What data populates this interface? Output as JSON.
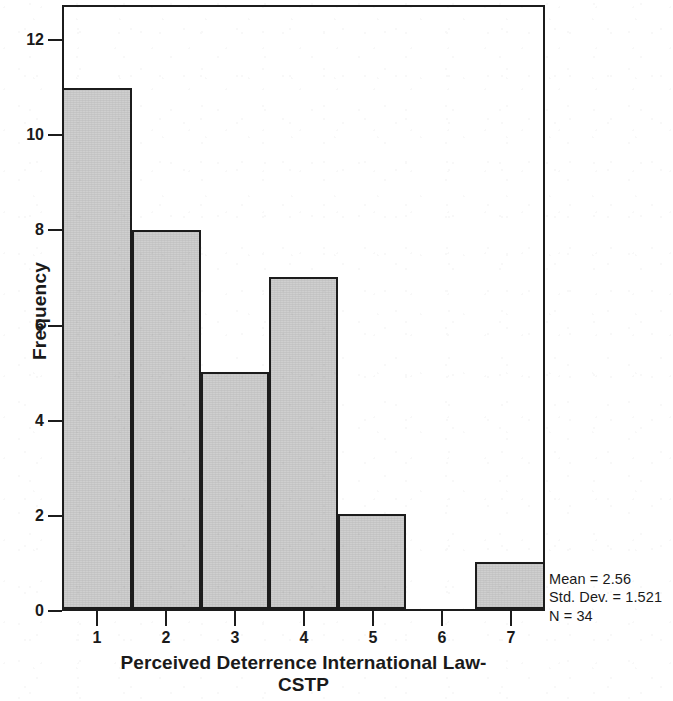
{
  "chart_data": {
    "type": "bar",
    "title": "",
    "subtitle": "",
    "xlabel": "Perceived Deterrence International Law-CSTP",
    "ylabel": "Frequency",
    "categories": [
      "1",
      "2",
      "3",
      "4",
      "5",
      "6",
      "7"
    ],
    "values": [
      11,
      8,
      5,
      7,
      2,
      0,
      1
    ],
    "xlim": [
      0.5,
      7.5
    ],
    "ylim": [
      0,
      12.7
    ],
    "x_ticks": [
      "1",
      "2",
      "3",
      "4",
      "5",
      "6",
      "7"
    ],
    "y_ticks": [
      "0",
      "2",
      "4",
      "6",
      "8",
      "10",
      "12"
    ],
    "y_tick_values": [
      0,
      2,
      4,
      6,
      8,
      10,
      12
    ],
    "grid": false,
    "legend": "none",
    "bar_fill_color": "#cfcfcf",
    "bar_edge_color": "#1c1c1c",
    "background_color": "#ffffff",
    "annotations": [
      "Mean = 2.56",
      "Std. Dev. = 1.521",
      "N = 34"
    ]
  },
  "statistics": {
    "mean_line": "Mean = 2.56",
    "stddev_line": "Std. Dev. = 1.521",
    "n_line": "N = 34"
  },
  "axes": {
    "x_title_line1": "Perceived Deterrence International Law-",
    "x_title_line2": "CSTP",
    "y_title": "Frequency"
  }
}
